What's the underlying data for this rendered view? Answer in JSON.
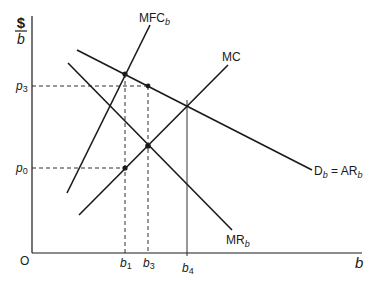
{
  "diagram": {
    "type": "economics-monopsony-bilateral",
    "y_axis": {
      "label_top": "$",
      "label_bottom": "b"
    },
    "x_axis": {
      "label": "b"
    },
    "origin_label": "O",
    "curves": [
      {
        "id": "mfc",
        "label": "MFC",
        "subscript": "b"
      },
      {
        "id": "mc",
        "label": "MC",
        "subscript": ""
      },
      {
        "id": "demand",
        "label": "D",
        "subscript": "b",
        "equals": " = AR",
        "equals_subscript": "b"
      },
      {
        "id": "mr",
        "label": "MR",
        "subscript": "b"
      }
    ],
    "y_ticks": [
      {
        "label": "p",
        "subscript": "3"
      },
      {
        "label": "p",
        "subscript": "0"
      }
    ],
    "x_ticks": [
      {
        "label": "b",
        "subscript": "1"
      },
      {
        "label": "b",
        "subscript": "3"
      },
      {
        "label": "b",
        "subscript": "4"
      }
    ]
  }
}
